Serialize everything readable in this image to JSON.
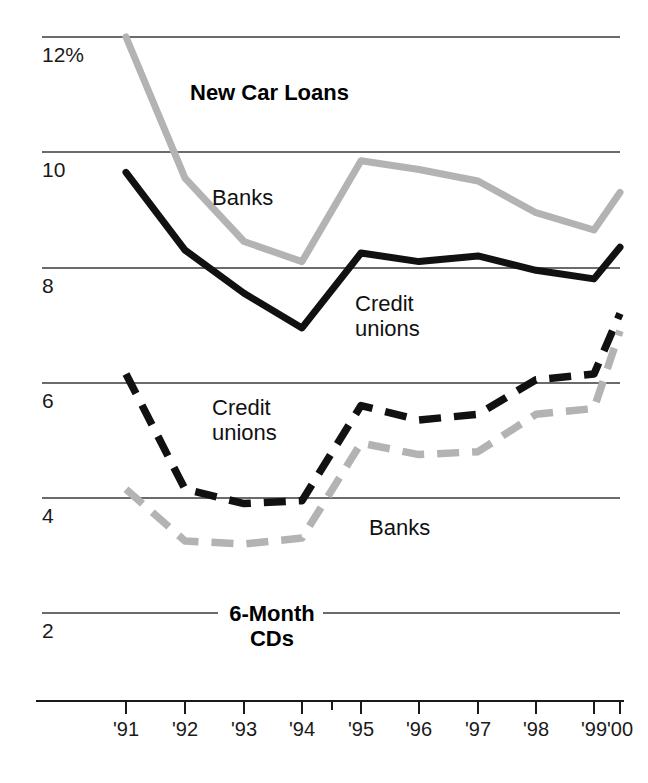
{
  "chart_data": {
    "type": "line",
    "title": "",
    "xlabel": "",
    "ylabel": "",
    "ylim": [
      2,
      12
    ],
    "xlim": [
      1991,
      2000
    ],
    "grid": true,
    "grid_axis": "y",
    "legend_position": "inline-annotations",
    "panels": [
      {
        "name": "New Car Loans",
        "title": "New Car Loans",
        "series": [
          {
            "name": "Banks",
            "label": "Banks",
            "style": "solid",
            "color": "#b3b3b3",
            "categories": [
              "'91",
              "'92",
              "'93",
              "'94",
              "'95",
              "'96",
              "'97",
              "'98",
              "'99",
              "'00"
            ],
            "values": [
              12.0,
              9.55,
              8.45,
              8.1,
              9.85,
              9.7,
              9.5,
              8.95,
              8.65,
              9.3
            ]
          },
          {
            "name": "Credit unions",
            "label": "Credit unions",
            "style": "solid",
            "color": "#111111",
            "categories": [
              "'91",
              "'92",
              "'93",
              "'94",
              "'95",
              "'96",
              "'97",
              "'98",
              "'99",
              "'00"
            ],
            "values": [
              9.65,
              8.3,
              7.55,
              6.95,
              8.25,
              8.1,
              8.2,
              7.95,
              7.8,
              8.35
            ]
          }
        ]
      },
      {
        "name": "6-Month CDs",
        "title": "6-Month\nCDs",
        "title_line1": "6-Month",
        "title_line2": "CDs",
        "series": [
          {
            "name": "Credit unions",
            "label": "Credit unions",
            "style": "dashed",
            "color": "#111111",
            "categories": [
              "'91",
              "'92",
              "'93",
              "'94",
              "'95",
              "'96",
              "'97",
              "'98",
              "'99",
              "'00"
            ],
            "values": [
              6.15,
              4.15,
              3.9,
              3.95,
              5.6,
              5.35,
              5.45,
              6.05,
              6.15,
              7.2
            ]
          },
          {
            "name": "Banks",
            "label": "Banks",
            "style": "dashed",
            "color": "#b3b3b3",
            "categories": [
              "'91",
              "'92",
              "'93",
              "'94",
              "'95",
              "'96",
              "'97",
              "'98",
              "'99",
              "'00"
            ],
            "values": [
              4.15,
              3.25,
              3.2,
              3.3,
              4.95,
              4.75,
              4.8,
              5.45,
              5.55,
              6.9
            ]
          }
        ]
      }
    ],
    "y_ticks": [
      {
        "value": 12,
        "label": "12%"
      },
      {
        "value": 10,
        "label": "10"
      },
      {
        "value": 8,
        "label": "8"
      },
      {
        "value": 6,
        "label": "6"
      },
      {
        "value": 4,
        "label": "4"
      },
      {
        "value": 2,
        "label": "2"
      }
    ],
    "x_ticks": [
      {
        "value": 1991,
        "label": "'91"
      },
      {
        "value": 1992,
        "label": "'92"
      },
      {
        "value": 1993,
        "label": "'93"
      },
      {
        "value": 1994,
        "label": "'94"
      },
      {
        "value": 1995,
        "label": "'95"
      },
      {
        "value": 1996,
        "label": "'96"
      },
      {
        "value": 1997,
        "label": "'97"
      },
      {
        "value": 1998,
        "label": "'98"
      },
      {
        "value": 1999,
        "label": "'99"
      },
      {
        "value": 2000,
        "label": "'00"
      }
    ],
    "annotations": [
      {
        "id": "new-car-loans-title",
        "text": "New Car Loans",
        "bold": true
      },
      {
        "id": "upper-banks-label",
        "text": "Banks",
        "bold": false
      },
      {
        "id": "upper-credit-unions-label",
        "text": "Credit\nunions",
        "line1": "Credit",
        "line2": "unions",
        "bold": false
      },
      {
        "id": "lower-credit-unions-label",
        "text": "Credit\nunions",
        "line1": "Credit",
        "line2": "unions",
        "bold": false
      },
      {
        "id": "lower-banks-label",
        "text": "Banks",
        "bold": false
      },
      {
        "id": "cds-title",
        "text": "6-Month CDs",
        "line1": "6-Month",
        "line2": "CDs",
        "bold": true
      }
    ],
    "colors": {
      "gray_series": "#b3b3b3",
      "black_series": "#111111",
      "gridline": "#3a3a3a",
      "background": "#ffffff"
    }
  }
}
